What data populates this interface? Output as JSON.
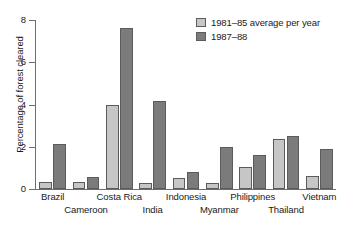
{
  "chart_data": {
    "type": "bar",
    "title": "",
    "xlabel": "",
    "ylabel": "Percentage of forest cleared",
    "ylim": [
      0,
      8
    ],
    "yticks": [
      0,
      2,
      4,
      6,
      8
    ],
    "ytick_labels": [
      "0",
      "2",
      "4",
      "6",
      "8"
    ],
    "grid": false,
    "legend_position": "top-right",
    "categories": [
      "Brazil",
      "Cameroon",
      "Costa Rica",
      "India",
      "Indonesia",
      "Myanmar",
      "Philippines",
      "Thailand",
      "Vietnam"
    ],
    "series": [
      {
        "name": "1981–85 average per year",
        "color": "#c6c6c6",
        "values": [
          0.35,
          0.35,
          4.0,
          0.3,
          0.5,
          0.3,
          1.05,
          2.35,
          0.6
        ]
      },
      {
        "name": "1987–88",
        "color": "#7b7b7b",
        "values": [
          2.15,
          0.55,
          7.6,
          4.15,
          0.8,
          2.0,
          1.6,
          2.5,
          1.9
        ]
      }
    ]
  },
  "legend": {
    "items": [
      {
        "label": "1981–85 average per year",
        "swatch": "light"
      },
      {
        "label": "1987–88",
        "swatch": "dark"
      }
    ]
  },
  "axes": {
    "y_title": "Percentage of forest cleared",
    "y_tick_labels": [
      "0",
      "2",
      "4",
      "6",
      "8"
    ]
  },
  "x_labels": [
    {
      "text": "Brazil",
      "row": 0
    },
    {
      "text": "Cameroon",
      "row": 1
    },
    {
      "text": "Costa Rica",
      "row": 0
    },
    {
      "text": "India",
      "row": 1
    },
    {
      "text": "Indonesia",
      "row": 0
    },
    {
      "text": "Myanmar",
      "row": 1
    },
    {
      "text": "Philippines",
      "row": 0
    },
    {
      "text": "Thailand",
      "row": 1
    },
    {
      "text": "Vietnam",
      "row": 0
    }
  ],
  "colors": {
    "series_light": "#c6c6c6",
    "series_dark": "#7b7b7b",
    "axis": "#6e6e6e",
    "bar_outline": "#5b5b5b",
    "background": "#ffffff"
  }
}
